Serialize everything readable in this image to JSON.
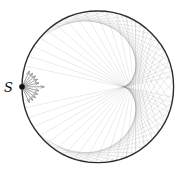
{
  "figure": {
    "type": "geometric-optics-diagram",
    "caption": "Point source S on a reflecting circle; reflected rays envelope a cardioid caustic",
    "background": "#ffffff",
    "width": 182,
    "height": 174,
    "circle": {
      "cx": 97.8,
      "cy": 86.8,
      "r": 75.8,
      "stroke": "#2d2d2d",
      "stroke_width": 1.4
    },
    "source": {
      "label": "S",
      "label_color": "#0a0a0a",
      "label_font_size": 13,
      "label_x": 4,
      "label_y": 92,
      "dot_color": "#101010",
      "dot_radius": 2.8
    },
    "emitted_arrows": {
      "angles_deg": [
        65,
        52,
        39,
        26,
        13,
        0,
        -13,
        -26,
        -39,
        -52,
        -65
      ],
      "length": 17,
      "axial_length": 22,
      "color": "#959595",
      "stroke_width": 0.9,
      "head_length": 3.2,
      "head_angle_deg": 24
    },
    "reflected_rays": {
      "alpha_min_deg": 4,
      "alpha_max_deg": 70,
      "step_deg": 2,
      "color": "#000000",
      "opacity": 0.1,
      "stroke_width": 0.8
    },
    "caustic": {
      "shape": "cardioid",
      "cusp_x": 123,
      "cusp_y": 87
    }
  }
}
